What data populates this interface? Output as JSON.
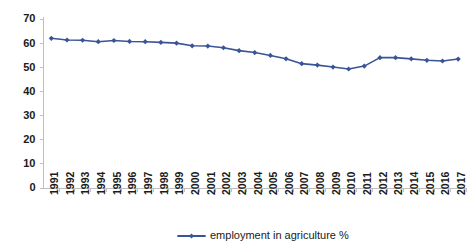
{
  "chart_data": {
    "type": "line",
    "title": "",
    "subtitle": "",
    "xlabel": "",
    "ylabel": "",
    "categories": [
      "1991",
      "1992",
      "1993",
      "1994",
      "1995",
      "1996",
      "1997",
      "1998",
      "1999",
      "2000",
      "2001",
      "2002",
      "2003",
      "2004",
      "2005",
      "2006",
      "2007",
      "2008",
      "2009",
      "2010",
      "2011",
      "2012",
      "2013",
      "2014",
      "2015",
      "2016",
      "2017"
    ],
    "series": [
      {
        "name": "employment in agriculture  %",
        "color": "#3A5595",
        "marker": "diamond",
        "values": [
          62.0,
          61.3,
          61.2,
          60.6,
          61.1,
          60.7,
          60.6,
          60.3,
          60.0,
          58.9,
          58.8,
          58.1,
          56.9,
          56.1,
          54.9,
          53.5,
          51.5,
          50.9,
          50.1,
          49.3,
          50.5,
          54.0,
          54.0,
          53.5,
          52.9,
          52.6,
          53.4
        ]
      }
    ],
    "ylim": [
      0,
      70
    ],
    "xlim_labels": [
      "1991",
      "2017"
    ],
    "ytick_values": [
      0,
      10,
      20,
      30,
      40,
      50,
      60,
      70
    ],
    "grid": false,
    "legend_position": "bottom-center",
    "legend_entries": [
      "employment in agriculture  %"
    ],
    "annotations": []
  },
  "colors": {
    "series_blue": "#3A5595",
    "axis_gray": "#bfbfbf",
    "text_black": "#1a1a1a",
    "background": "#ffffff"
  }
}
